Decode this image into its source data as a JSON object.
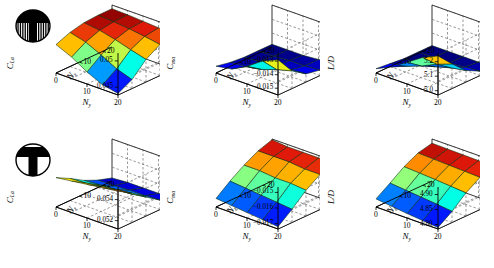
{
  "figure": {
    "kind": "surface-plot-grid",
    "rows": 2,
    "cols": 3,
    "width": 494,
    "height": 268,
    "background": "#ffffff",
    "colormap": "jet",
    "colormap_stops": [
      "#00007f",
      "#0000ff",
      "#0080ff",
      "#00ffff",
      "#7fff7f",
      "#ffff00",
      "#ff8000",
      "#ff0000",
      "#7f0000"
    ]
  },
  "badges": [
    {
      "name": "config-icon-top",
      "shape": "circle-T-with-stripes",
      "fill": "#000000",
      "row": 1
    },
    {
      "name": "config-icon-bottom",
      "shape": "circle-solid-T",
      "fill": "#000000",
      "row": 2
    }
  ],
  "axes": {
    "x_label": "N",
    "x_sub": "y",
    "x_ticks": [
      "20",
      "10",
      "0"
    ],
    "z_label": "N",
    "z_sub": "z",
    "z_ticks": [
      "10",
      "20"
    ]
  },
  "chart_data": [
    {
      "type": "surface",
      "panel": "top-left",
      "row": 1,
      "col": 1,
      "title": "",
      "zlabel": "C",
      "zlabel_sub": "La",
      "xlabel": "N",
      "xlabel_sub": "y",
      "ylabel": "N",
      "ylabel_sub": "z",
      "ztick_labels": [
        "0.045",
        "0.05"
      ],
      "ztick_values": [
        0.045,
        0.05
      ],
      "zlim": [
        0.0435,
        0.0515
      ],
      "xlim": [
        0,
        24
      ],
      "ylim": [
        0,
        24
      ],
      "x": [
        0,
        6,
        12,
        18,
        24
      ],
      "y": [
        0,
        6,
        12,
        18,
        24
      ],
      "values": [
        [
          0.0438,
          0.0452,
          0.0478,
          0.0494,
          0.05
        ],
        [
          0.0444,
          0.0462,
          0.0486,
          0.0499,
          0.0503
        ],
        [
          0.0458,
          0.0478,
          0.0495,
          0.0503,
          0.0505
        ],
        [
          0.0476,
          0.0492,
          0.0502,
          0.0506,
          0.0507
        ],
        [
          0.0489,
          0.05,
          0.0506,
          0.0508,
          0.0508
        ]
      ],
      "grid": true,
      "legend": "none"
    },
    {
      "type": "surface",
      "panel": "top-middle",
      "row": 1,
      "col": 2,
      "title": "",
      "zlabel": "C",
      "zlabel_sub": "ma",
      "xlabel": "N",
      "xlabel_sub": "y",
      "ylabel": "N",
      "ylabel_sub": "z",
      "ztick_labels": [
        "-0.015",
        "-0.014",
        "-0.013"
      ],
      "ztick_values": [
        -0.015,
        -0.014,
        -0.013
      ],
      "zlim": [
        -0.0155,
        -0.0124
      ],
      "xlim": [
        0,
        24
      ],
      "ylim": [
        0,
        24
      ],
      "x": [
        0,
        6,
        12,
        18,
        24
      ],
      "y": [
        0,
        6,
        12,
        18,
        24
      ],
      "values": [
        [
          -0.0129,
          -0.0142,
          -0.0149,
          -0.0151,
          -0.0151
        ],
        [
          -0.0134,
          -0.0145,
          -0.015,
          -0.0152,
          -0.0152
        ],
        [
          -0.0142,
          -0.0149,
          -0.0152,
          -0.0152,
          -0.0153
        ],
        [
          -0.0148,
          -0.0151,
          -0.0152,
          -0.0153,
          -0.0153
        ],
        [
          -0.015,
          -0.0152,
          -0.0153,
          -0.0153,
          -0.0153
        ]
      ],
      "grid": true,
      "legend": "none"
    },
    {
      "type": "surface",
      "panel": "top-right",
      "row": 1,
      "col": 3,
      "title": "",
      "zlabel": "L/D",
      "zlabel_sub": "",
      "xlabel": "N",
      "xlabel_sub": "y",
      "ylabel": "N",
      "ylabel_sub": "z",
      "ztick_labels": [
        "5.0",
        "5.1",
        "5.2"
      ],
      "ztick_values": [
        5.0,
        5.1,
        5.2
      ],
      "zlim": [
        4.97,
        5.26
      ],
      "xlim": [
        0,
        24
      ],
      "ylim": [
        0,
        24
      ],
      "x": [
        0,
        6,
        12,
        18,
        24
      ],
      "y": [
        0,
        6,
        12,
        18,
        24
      ],
      "values": [
        [
          5.24,
          5.14,
          5.05,
          5.0,
          4.99
        ],
        [
          5.19,
          5.1,
          5.03,
          4.99,
          4.98
        ],
        [
          5.12,
          5.05,
          5.0,
          4.98,
          4.98
        ],
        [
          5.05,
          5.01,
          4.98,
          4.98,
          4.98
        ],
        [
          5.0,
          4.99,
          4.98,
          4.98,
          4.98
        ]
      ],
      "grid": true,
      "legend": "none"
    },
    {
      "type": "surface",
      "panel": "bottom-left",
      "row": 2,
      "col": 1,
      "title": "",
      "zlabel": "C",
      "zlabel_sub": "La",
      "xlabel": "N",
      "xlabel_sub": "y",
      "ylabel": "N",
      "ylabel_sub": "z",
      "ztick_labels": [
        "0.052",
        "0.054"
      ],
      "ztick_values": [
        0.052,
        0.054
      ],
      "zlim": [
        0.0512,
        0.0552
      ],
      "xlim": [
        0,
        24
      ],
      "ylim": [
        0,
        24
      ],
      "x": [
        0,
        6,
        12,
        18,
        24
      ],
      "y": [
        0,
        6,
        12,
        18,
        24
      ],
      "values": [
        [
          0.0548,
          0.054,
          0.053,
          0.0521,
          0.0516
        ],
        [
          0.0546,
          0.0538,
          0.0528,
          0.052,
          0.0516
        ],
        [
          0.0544,
          0.0536,
          0.0527,
          0.052,
          0.0516
        ],
        [
          0.0542,
          0.0534,
          0.0526,
          0.0519,
          0.0516
        ],
        [
          0.054,
          0.0533,
          0.0525,
          0.0519,
          0.0515
        ]
      ],
      "grid": true,
      "legend": "none"
    },
    {
      "type": "surface",
      "panel": "bottom-middle",
      "row": 2,
      "col": 2,
      "title": "",
      "zlabel": "C",
      "zlabel_sub": "ma",
      "xlabel": "N",
      "xlabel_sub": "y",
      "ylabel": "N",
      "ylabel_sub": "z",
      "ztick_labels": [
        "-0.017",
        "-0.016",
        "-0.015"
      ],
      "ztick_values": [
        -0.017,
        -0.016,
        -0.015
      ],
      "zlim": [
        -0.01735,
        -0.01465
      ],
      "xlim": [
        0,
        24
      ],
      "ylim": [
        0,
        24
      ],
      "x": [
        0,
        6,
        12,
        18,
        24
      ],
      "y": [
        0,
        6,
        12,
        18,
        24
      ],
      "values": [
        [
          -0.0172,
          -0.0165,
          -0.0157,
          -0.0151,
          -0.0148
        ],
        [
          -0.0171,
          -0.0164,
          -0.0156,
          -0.0151,
          -0.0148
        ],
        [
          -0.017,
          -0.0163,
          -0.0156,
          -0.015,
          -0.0148
        ],
        [
          -0.0169,
          -0.0162,
          -0.0155,
          -0.015,
          -0.0148
        ],
        [
          -0.0168,
          -0.0161,
          -0.0155,
          -0.015,
          -0.0147
        ]
      ],
      "grid": true,
      "legend": "none"
    },
    {
      "type": "surface",
      "panel": "bottom-right",
      "row": 2,
      "col": 3,
      "title": "",
      "zlabel": "L/D",
      "zlabel_sub": "",
      "xlabel": "N",
      "xlabel_sub": "y",
      "ylabel": "N",
      "ylabel_sub": "z",
      "ztick_labels": [
        "4.80",
        "4.85",
        "4.90"
      ],
      "ztick_values": [
        4.8,
        4.85,
        4.9
      ],
      "zlim": [
        4.785,
        4.925
      ],
      "xlim": [
        0,
        24
      ],
      "ylim": [
        0,
        24
      ],
      "x": [
        0,
        6,
        12,
        18,
        24
      ],
      "y": [
        0,
        6,
        12,
        18,
        24
      ],
      "values": [
        [
          4.79,
          4.822,
          4.862,
          4.892,
          4.906
        ],
        [
          4.795,
          4.828,
          4.866,
          4.894,
          4.908
        ],
        [
          4.8,
          4.833,
          4.87,
          4.896,
          4.909
        ],
        [
          4.806,
          4.838,
          4.873,
          4.898,
          4.91
        ],
        [
          4.812,
          4.843,
          4.876,
          4.9,
          4.911
        ]
      ],
      "grid": true,
      "legend": "none"
    }
  ]
}
